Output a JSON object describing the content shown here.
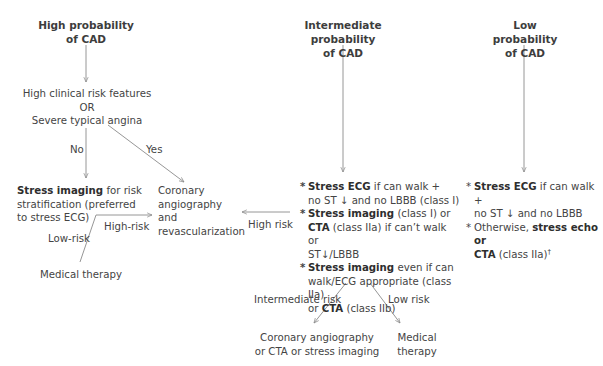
{
  "columns": {
    "high": {
      "title_line1": "High probability",
      "title_line2": "of CAD",
      "criteria_line1": "High clinical risk features",
      "criteria_line2": "OR",
      "criteria_line3": "Severe typical angina",
      "no_label": "No",
      "yes_label": "Yes",
      "stress_bold": "Stress imaging",
      "stress_rest1": " for risk",
      "stress_line2": "stratification (preferred",
      "stress_line3": "to stress ECG)",
      "high_risk_label": "High-risk",
      "low_risk_label": "Low-risk",
      "medical_therapy": "Medical therapy"
    },
    "revasc": {
      "line1": "Coronary",
      "line2": "angiography",
      "line3": "and",
      "line4": "revascularization"
    },
    "intermediate": {
      "title_line1": "Intermediate probability",
      "title_line2": "of CAD",
      "high_risk_label": "High risk",
      "bullets": [
        {
          "star": "*",
          "bold1": "Stress ECG",
          "text1": " if can walk +",
          "text2": "no ST ↓ and no LBBB (class I)"
        },
        {
          "star": "*",
          "bold1": "Stress imaging",
          "text1": " (class I) or",
          "bold2": "CTA",
          "text2": " (class IIa) if can’t walk or",
          "text3": "ST↓/LBBB"
        },
        {
          "star": "*",
          "bold1": "Stress imaging",
          "text1": " even if can",
          "text2": "walk/ECG appropriate (class IIa)",
          "text3a": "or ",
          "bold2": "CTA",
          "text3b": " (class IIb)"
        }
      ],
      "intermediate_risk_label": "Intermediate risk",
      "low_risk_label": "Low risk",
      "outcome_left_line1": "Coronary angiography",
      "outcome_left_line2": "or CTA or stress imaging",
      "outcome_right_line1": "Medical",
      "outcome_right_line2": "therapy"
    },
    "low": {
      "title_line1": "Low probability",
      "title_line2": "of CAD",
      "bullets": [
        {
          "star": "*",
          "bold1": "Stress ECG",
          "text1": " if can walk +",
          "text2": "no ST ↓ and no LBBB"
        },
        {
          "star": "*",
          "text1a": "Otherwise, ",
          "bold1": "stress echo or",
          "bold2": "CTA",
          "text2": " (class IIa)",
          "sup": "†"
        }
      ]
    }
  },
  "colors": {
    "line": "#8a8a8a",
    "text": "#444444",
    "background": "#ffffff"
  }
}
